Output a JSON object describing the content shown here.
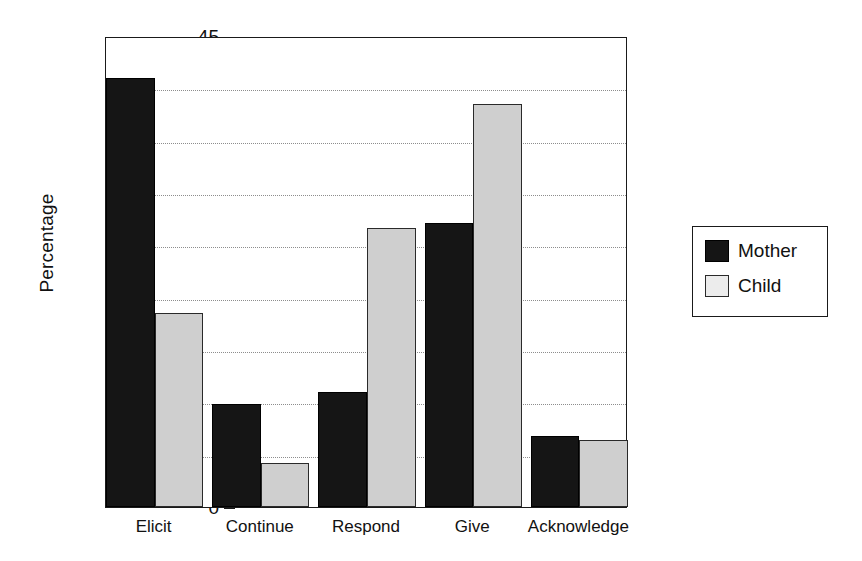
{
  "chart_data": {
    "type": "bar",
    "title": "",
    "subtitle": "",
    "xlabel": "",
    "ylabel": "Percentage",
    "categories": [
      "Elicit",
      "Continue",
      "Respond",
      "Give",
      "Acknowledge"
    ],
    "series": [
      {
        "name": "Mother",
        "color": "#151515",
        "values": [
          41.0,
          9.8,
          11.0,
          27.1,
          6.8
        ]
      },
      {
        "name": "Child",
        "color": "#cfcfcf",
        "values": [
          18.5,
          4.2,
          26.7,
          38.5,
          6.4
        ]
      }
    ],
    "ylim": [
      0,
      45
    ],
    "yticks": [
      0,
      5,
      10,
      15,
      20,
      25,
      30,
      35,
      40,
      45
    ],
    "ytick_labels": [
      "0",
      "5",
      "10",
      "15",
      "20",
      "25",
      "30",
      "35",
      "40",
      "45"
    ],
    "y_minor_tick_step": 1,
    "grid": "horizontal-dotted",
    "grid_values": [
      5,
      10,
      15,
      20,
      25,
      30,
      35,
      40
    ],
    "legend": {
      "position": "right",
      "entries": [
        {
          "label": "Mother",
          "swatch": "black-filled"
        },
        {
          "label": "Child",
          "swatch": "light-gray-filled"
        }
      ]
    },
    "frame": "box",
    "background": "#ffffff"
  }
}
